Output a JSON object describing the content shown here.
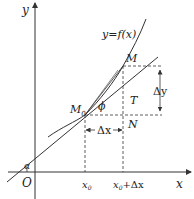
{
  "diagram": {
    "type": "derivative-geometric-interpretation",
    "colors": {
      "stroke": "#333333",
      "text": "#222222",
      "background": "#ffffff"
    },
    "axes": {
      "x_label": "x",
      "y_label": "y",
      "origin_label": "O"
    },
    "curve_label": "y=f(x)",
    "points": {
      "m0": {
        "label": "M",
        "subscript": "0"
      },
      "m": {
        "label": "M"
      },
      "n": {
        "label": "N"
      },
      "t": {
        "label": "T"
      }
    },
    "angles": {
      "alpha": "α",
      "phi": "ϕ"
    },
    "increments": {
      "delta_x": "Δx",
      "delta_y": "Δy"
    },
    "x_ticks": {
      "x0": {
        "main": "x",
        "sub": "0"
      },
      "x0_plus_dx": {
        "main": "x",
        "sub": "0",
        "rest": "+Δx"
      }
    }
  }
}
